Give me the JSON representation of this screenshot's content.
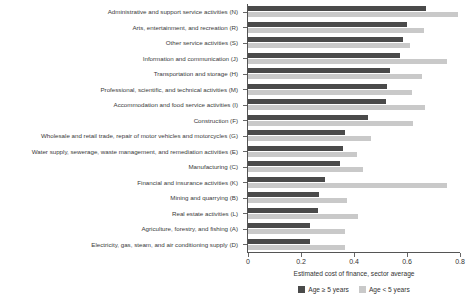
{
  "chart_data": {
    "type": "bar",
    "orientation": "horizontal",
    "title": "",
    "xlabel": "Estimated cost of finance, sector average",
    "ylabel": "",
    "xlim": [
      0,
      0.8
    ],
    "xticks": [
      "0",
      "0.2",
      "0.4",
      "0.6",
      "0.8"
    ],
    "xtick_values": [
      0,
      0.2,
      0.4,
      0.6,
      0.8
    ],
    "grid": false,
    "legend_position": "bottom-center",
    "categories": [
      "Administrative and support service activities (N)",
      "Arts, entertainment, and recreation (R)",
      "Other service activities (S)",
      "Information and communication (J)",
      "Transportation and storage (H)",
      "Professional, scientific, and technical activities (M)",
      "Accommodation and food service activities (I)",
      "Construction (F)",
      "Wholesale and retail trade, repair of motor vehicles and motorcycles (G)",
      "Water supply, sewerage, waste management, and remediation activities (E)",
      "Manufacturing (C)",
      "Financial and insurance activities (K)",
      "Mining and quarrying (B)",
      "Real estate activities (L)",
      "Agriculture, forestry, and fishing (A)",
      "Electricity, gas, steam, and air conditioning supply (D)"
    ],
    "series": [
      {
        "name": "Age ≥ 5 years",
        "color": "#4a4a4a",
        "values": [
          0.672,
          0.6,
          0.585,
          0.573,
          0.536,
          0.525,
          0.521,
          0.453,
          0.366,
          0.358,
          0.347,
          0.291,
          0.268,
          0.264,
          0.234,
          0.234
        ]
      },
      {
        "name": "Age < 5 years",
        "color": "#c9c9c9",
        "values": [
          0.792,
          0.664,
          0.611,
          0.751,
          0.657,
          0.619,
          0.668,
          0.623,
          0.464,
          0.411,
          0.434,
          0.751,
          0.373,
          0.415,
          0.366,
          0.366
        ]
      }
    ]
  },
  "legend": {
    "items": [
      {
        "label": "Age ≥ 5 years",
        "color": "#4a4a4a"
      },
      {
        "label": "Age < 5 years",
        "color": "#c9c9c9"
      }
    ]
  }
}
